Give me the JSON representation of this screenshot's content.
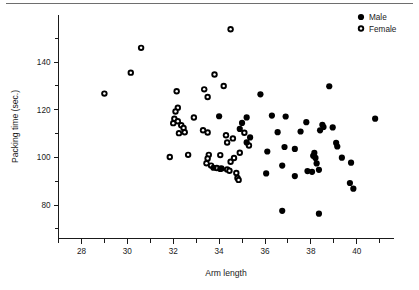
{
  "figure": {
    "title": "",
    "has_top_rule": true,
    "background": "#ffffff",
    "foreground": "#1a1a1a"
  },
  "axes": {
    "x": {
      "label": "Arm length",
      "ticks": [
        "28",
        "30",
        "32",
        "34",
        "36",
        "38",
        "40"
      ],
      "range": [
        27.0,
        41.6
      ],
      "minor_ticks": true
    },
    "y": {
      "label": "Packing time (sec.)",
      "ticks": [
        "140",
        "120",
        "100",
        "80"
      ],
      "range": [
        66,
        160
      ],
      "minor_ticks": true
    }
  },
  "legend": {
    "position": "top-right",
    "entries": [
      {
        "label": "Male",
        "marker": "filled-circle",
        "color": "#000000"
      },
      {
        "label": "Female",
        "marker": "open-circle",
        "color": "#000000"
      }
    ]
  },
  "chart_data": {
    "type": "scatter",
    "title": "",
    "xlabel": "Arm length",
    "ylabel": "Packing time (sec.)",
    "xlim": [
      27.0,
      41.6
    ],
    "ylim": [
      66,
      160
    ],
    "xticks": [
      28,
      30,
      32,
      34,
      36,
      38,
      40
    ],
    "yticks": [
      80,
      100,
      120,
      140
    ],
    "grid": false,
    "legend_position": "top-right",
    "series": [
      {
        "name": "Female",
        "marker": "open-circle",
        "color": "#000000",
        "points": [
          [
            29.0,
            126.8
          ],
          [
            30.15,
            135.6
          ],
          [
            30.6,
            146.0
          ],
          [
            34.5,
            153.8
          ],
          [
            33.8,
            134.8
          ],
          [
            34.2,
            130.0
          ],
          [
            33.35,
            128.6
          ],
          [
            32.15,
            127.8
          ],
          [
            33.5,
            125.4
          ],
          [
            32.9,
            116.8
          ],
          [
            32.2,
            120.9
          ],
          [
            32.1,
            119.3
          ],
          [
            32.05,
            116.3
          ],
          [
            32.2,
            115.2
          ],
          [
            32.0,
            114.4
          ],
          [
            32.35,
            113.5
          ],
          [
            32.45,
            112.4
          ],
          [
            32.5,
            110.6
          ],
          [
            32.25,
            110.2
          ],
          [
            33.3,
            111.4
          ],
          [
            33.5,
            110.5
          ],
          [
            34.3,
            109.3
          ],
          [
            34.6,
            108.0
          ],
          [
            34.35,
            106.3
          ],
          [
            35.1,
            110.4
          ],
          [
            35.3,
            105.0
          ],
          [
            34.9,
            102.0
          ],
          [
            33.55,
            101.1
          ],
          [
            34.05,
            101.0
          ],
          [
            33.5,
            99.6
          ],
          [
            31.85,
            100.2
          ],
          [
            32.65,
            101.1
          ],
          [
            33.45,
            97.6
          ],
          [
            33.65,
            96.6
          ],
          [
            33.9,
            95.6
          ],
          [
            34.1,
            95.4
          ],
          [
            34.35,
            95.0
          ],
          [
            34.5,
            98.2
          ],
          [
            34.65,
            99.8
          ],
          [
            34.75,
            93.5
          ],
          [
            34.8,
            91.4
          ],
          [
            34.85,
            90.6
          ],
          [
            34.45,
            94.4
          ]
        ]
      },
      {
        "name": "Male",
        "marker": "filled-circle",
        "color": "#000000",
        "points": [
          [
            35.8,
            126.5
          ],
          [
            38.8,
            129.9
          ],
          [
            40.8,
            116.3
          ],
          [
            36.3,
            117.6
          ],
          [
            36.9,
            117.2
          ],
          [
            34.0,
            117.3
          ],
          [
            35.2,
            116.8
          ],
          [
            35.0,
            114.5
          ],
          [
            34.9,
            112.0
          ],
          [
            37.8,
            114.8
          ],
          [
            38.5,
            113.7
          ],
          [
            38.55,
            112.8
          ],
          [
            38.95,
            112.6
          ],
          [
            38.4,
            111.4
          ],
          [
            37.55,
            110.9
          ],
          [
            36.55,
            110.6
          ],
          [
            35.35,
            108.4
          ],
          [
            35.2,
            106.3
          ],
          [
            39.1,
            106.1
          ],
          [
            39.15,
            104.6
          ],
          [
            36.85,
            104.4
          ],
          [
            37.3,
            103.6
          ],
          [
            36.1,
            102.5
          ],
          [
            38.15,
            101.9
          ],
          [
            38.1,
            100.7
          ],
          [
            38.2,
            99.8
          ],
          [
            39.35,
            99.9
          ],
          [
            38.25,
            97.5
          ],
          [
            36.75,
            96.6
          ],
          [
            39.75,
            97.8
          ],
          [
            37.85,
            94.3
          ],
          [
            38.05,
            94.0
          ],
          [
            38.35,
            94.8
          ],
          [
            36.05,
            93.3
          ],
          [
            37.3,
            92.2
          ],
          [
            39.7,
            89.3
          ],
          [
            39.85,
            86.9
          ],
          [
            36.75,
            77.6
          ],
          [
            38.35,
            76.4
          ],
          [
            33.75,
            95.7
          ],
          [
            34.05,
            95.2
          ]
        ]
      }
    ],
    "counts": {
      "Female": 43,
      "Male": 41,
      "total": 84
    }
  }
}
